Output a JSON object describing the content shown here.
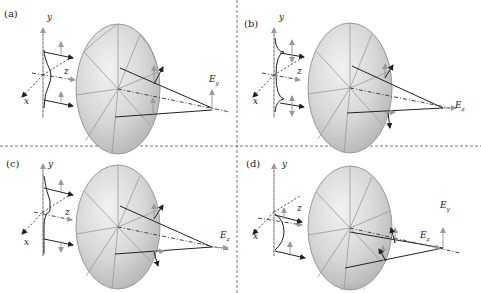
{
  "figure": {
    "panels": [
      {
        "id": "a",
        "label": "(a)",
        "axes": {
          "x": "x",
          "y": "y",
          "z": "z"
        },
        "field_label": "E",
        "field_sub": "y",
        "field_direction": "vertical",
        "input_profile": "single-bump"
      },
      {
        "id": "b",
        "label": "(b)",
        "axes": {
          "x": "x",
          "y": "y",
          "z": "z"
        },
        "field_label": "E",
        "field_sub": "z",
        "field_direction": "longitudinal",
        "input_profile": "double-gaussian"
      },
      {
        "id": "c",
        "label": "(c)",
        "axes": {
          "x": "x",
          "y": "y",
          "z": "z"
        },
        "field_label": "E",
        "field_sub": "z",
        "field_direction": "longitudinal",
        "input_profile": "step"
      },
      {
        "id": "d",
        "label": "(d)",
        "axes": {
          "x": "x",
          "y": "y",
          "z": "z"
        },
        "field_labels": [
          {
            "label": "E",
            "sub": "y"
          },
          {
            "label": "E",
            "sub": "z"
          }
        ],
        "input_profile": "single-bump"
      }
    ],
    "colors": {
      "lens_fill": "#d9d9d9",
      "lens_edge": "#9a9a9a",
      "ray": "#222222",
      "gray_arrow": "#9a9a9a",
      "divider": "#777777"
    },
    "caption_fragment": "[20,21]"
  }
}
